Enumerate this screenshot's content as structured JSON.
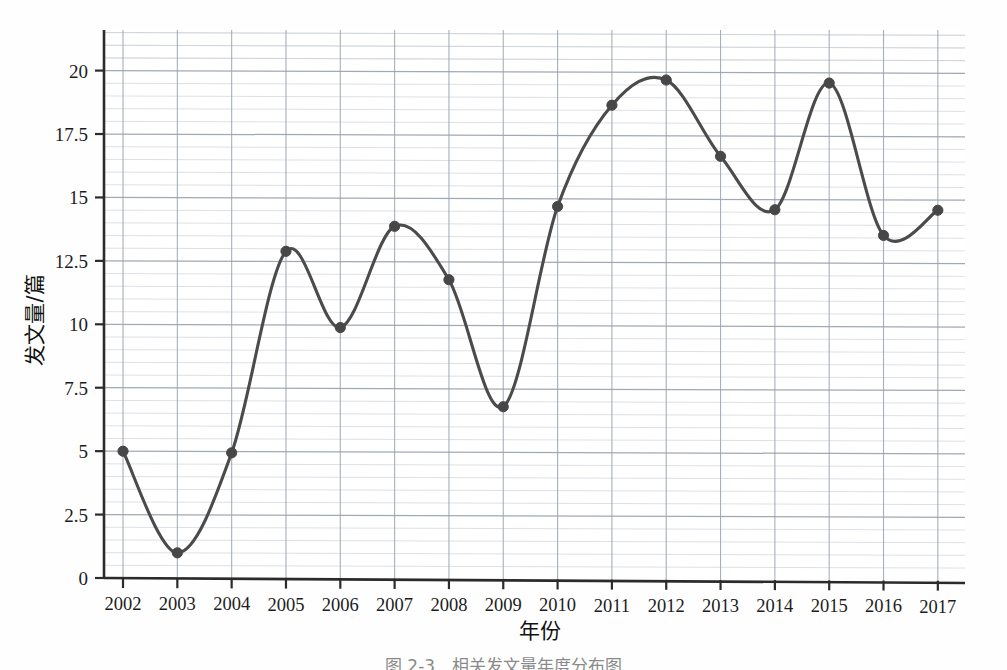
{
  "figure": {
    "caption": "图 2-3　相关发文量年度分布图",
    "corner_mark": ""
  },
  "chart_data": {
    "type": "line",
    "title": "",
    "xlabel": "年份",
    "ylabel": "发文量/篇",
    "categories": [
      "2002",
      "2003",
      "2004",
      "2005",
      "2006",
      "2007",
      "2008",
      "2009",
      "2010",
      "2011",
      "2012",
      "2013",
      "2014",
      "2015",
      "2016",
      "2017"
    ],
    "values": [
      5.0,
      1.0,
      4.95,
      12.9,
      9.9,
      13.9,
      11.8,
      6.8,
      14.7,
      18.7,
      19.7,
      16.7,
      14.6,
      19.6,
      13.6,
      14.6
    ],
    "series": [
      {
        "name": "发文量",
        "values": [
          5.0,
          1.0,
          4.95,
          12.9,
          9.9,
          13.9,
          11.8,
          6.8,
          14.7,
          18.7,
          19.7,
          16.7,
          14.6,
          19.6,
          13.6,
          14.6
        ]
      }
    ],
    "xlim": [
      2001.65,
      2017.5
    ],
    "ylim": [
      0,
      21.6
    ],
    "yticks": [
      0,
      2.5,
      5,
      7.5,
      10,
      12.5,
      15,
      17.5,
      20
    ],
    "ytick_labels": [
      "0",
      "2.5",
      "5",
      "7.5",
      "10",
      "12.5",
      "15",
      "17.5",
      "20"
    ],
    "xtick_labels": [
      "2002",
      "2003",
      "2004",
      "2005",
      "2006",
      "2007",
      "2008",
      "2009",
      "2010",
      "2011",
      "2012",
      "2013",
      "2014",
      "2015",
      "2016",
      "2017"
    ],
    "grid": true,
    "grid_minor": true,
    "minor_y_step": 0.5,
    "legend": "none",
    "line_color": "#4b4b4b",
    "marker_color": "#474747",
    "marker_shape": "circle",
    "smoothing": "spline",
    "grid_major_color": "#9aa3ad",
    "grid_minor_color": "#c7cdd4",
    "axis_color": "#2b2b2b",
    "background": "#ffffff"
  }
}
